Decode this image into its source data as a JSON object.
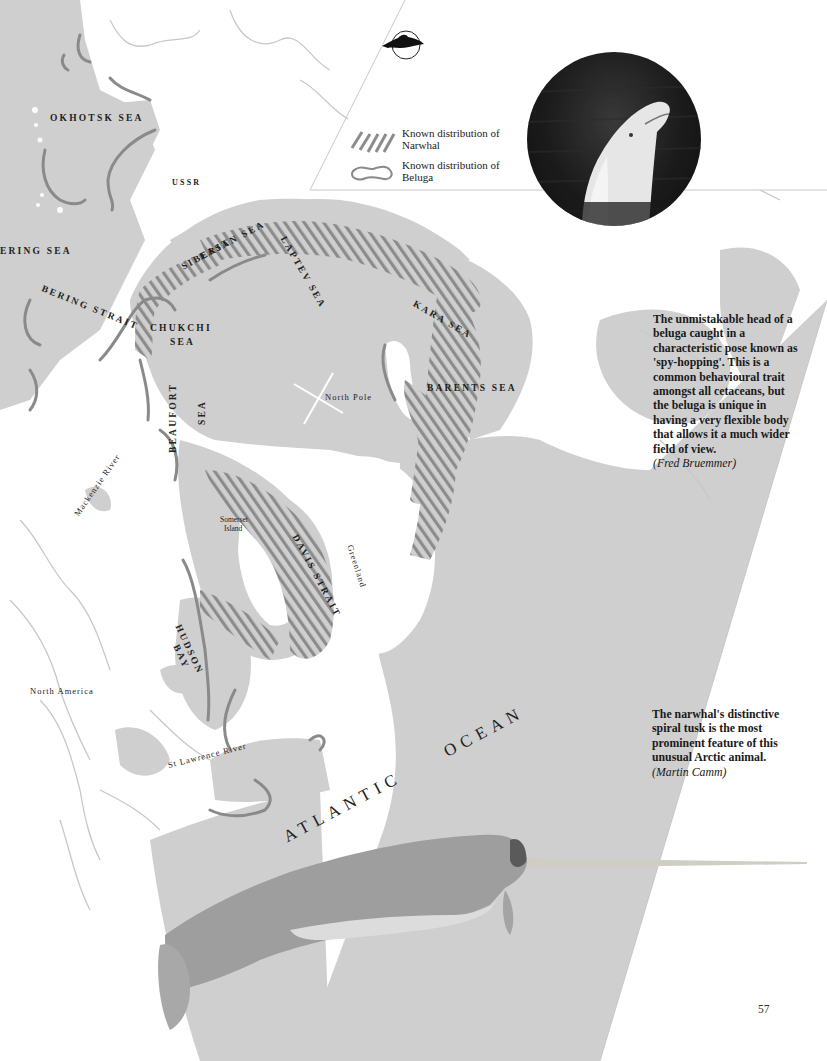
{
  "page": {
    "number": "57",
    "colors": {
      "sea": "#cfcfcf",
      "land": "#ffffff",
      "hatch": "#8c8c8c",
      "beluga_outline": "#8a8a8a",
      "river": "#c6c6c6",
      "text": "#1a1a1a"
    }
  },
  "logo": {
    "icon": "dolphin-in-circle-icon"
  },
  "legend": {
    "items": [
      {
        "swatch": "diagonal-hatch",
        "label": "Known distribution of Narwhal"
      },
      {
        "swatch": "rounded-outline",
        "label": "Known distribution of Beluga"
      }
    ]
  },
  "map": {
    "labels": {
      "okhotsk_sea": "OKHOTSK SEA",
      "ussr": "USSR",
      "bering_sea": "ERING SEA",
      "bering_strait": "BERING STRAIT",
      "east_siberian_sea_1": "EAST",
      "east_siberian_sea_2": "SIBERIAN SEA",
      "laptev_sea": "LAPTEV SEA",
      "kara_sea": "KARA SEA",
      "chukchi_sea_1": "CHUKCHI",
      "chukchi_sea_2": "SEA",
      "north_pole": "North Pole",
      "barents_sea": "BARENTS SEA",
      "beaufort_sea_1": "BEAUFORT",
      "beaufort_sea_2": "SEA",
      "mackenzie_river": "Mackenzie River",
      "somerset_island_1": "Somerset",
      "somerset_island_2": "Island",
      "greenland": "Greenland",
      "davis_strait": "DAVIS STRAIT",
      "hudson_bay_1": "HUDSON",
      "hudson_bay_2": "BAY",
      "north_america": "North America",
      "st_lawrence_river": "St Lawrence River",
      "atlantic_ocean": "ATLANTIC OCEAN"
    }
  },
  "photo": {
    "subject": "beluga-spy-hopping-photo"
  },
  "captions": {
    "beluga": {
      "text": "The unmistakable head of a beluga caught in a characteristic pose known as 'spy-hopping'. This is a common behavioural trait amongst all cetaceans, but the beluga is unique in having a very flexible body that allows it a much wider field of view.",
      "credit": "(Fred Bruemmer)"
    },
    "narwhal": {
      "text": "The narwhal's distinctive spiral tusk is the most prominent feature of this unusual Arctic animal.",
      "credit": "(Martin Camm)"
    }
  },
  "illustration": {
    "subject": "narwhal-illustration"
  }
}
